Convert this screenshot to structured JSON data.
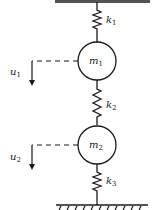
{
  "diagram": {
    "masses": [
      {
        "id": "m1",
        "label": "m",
        "sub": "1"
      },
      {
        "id": "m2",
        "label": "m",
        "sub": "2"
      }
    ],
    "springs": [
      {
        "id": "k1",
        "label": "k",
        "sub": "1"
      },
      {
        "id": "k2",
        "label": "k",
        "sub": "2"
      },
      {
        "id": "k3",
        "label": "k",
        "sub": "3"
      }
    ],
    "displacements": [
      {
        "id": "u1",
        "label": "u",
        "sub": "1"
      },
      {
        "id": "u2",
        "label": "u",
        "sub": "2"
      }
    ],
    "colors": {
      "ink": "#1a1a1a",
      "background": "#ffffff"
    }
  }
}
